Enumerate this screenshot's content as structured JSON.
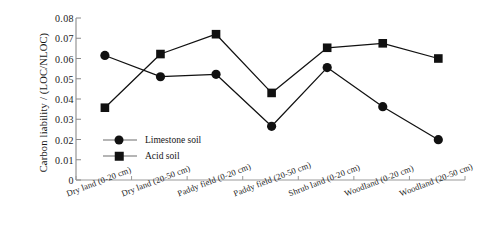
{
  "chart_data": {
    "type": "line",
    "title": "",
    "xlabel": "",
    "ylabel": "Carbon liability / (LOC/NLOC)",
    "ylim": [
      0,
      0.08
    ],
    "ytick_labels": [
      "0.08",
      "0.07",
      "0.06",
      "0.05",
      "0.04",
      "0.03",
      "0.02",
      "0.01",
      "0"
    ],
    "ytick_values": [
      0.08,
      0.07,
      0.06,
      0.05,
      0.04,
      0.03,
      0.02,
      0.01,
      0
    ],
    "grid": false,
    "legend_position": "inside-lower-left",
    "categories": [
      "Dry land (0-20 cm)",
      "Dry land (20-50 cm)",
      "Paddy field (0-20 cm)",
      "Paddy field (20-50 cm)",
      "Shrub land (0-20 cm)",
      "Woodland (0-20 cm)",
      "Woodland (20-50 cm)"
    ],
    "series": [
      {
        "name": "Limestone soil",
        "marker": "circle",
        "color": "#111111",
        "values": [
          0.0615,
          0.051,
          0.0522,
          0.0265,
          0.0555,
          0.0362,
          0.0199
        ]
      },
      {
        "name": "Acid soil",
        "marker": "square",
        "color": "#111111",
        "values": [
          0.0357,
          0.0622,
          0.072,
          0.043,
          0.0653,
          0.0675,
          0.06
        ]
      }
    ]
  },
  "legend": {
    "items": [
      {
        "label": "Limestone  soil",
        "marker": "circle"
      },
      {
        "label": "Acid soil",
        "marker": "square"
      }
    ]
  }
}
